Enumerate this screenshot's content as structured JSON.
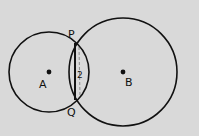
{
  "diagram": {
    "background": "#d9d9d9",
    "stroke_color": "#111111",
    "circles": [
      {
        "name": "A",
        "label": "A",
        "cx": 49,
        "cy": 72,
        "r": 40
      },
      {
        "name": "B",
        "label": "B",
        "cx": 123,
        "cy": 72,
        "r": 54
      }
    ],
    "points": {
      "P": {
        "label": "P",
        "x": 75,
        "y": 43
      },
      "Q": {
        "label": "Q",
        "x": 75,
        "y": 100
      }
    },
    "chord": {
      "from": "P",
      "to": "Q"
    },
    "region_label": "2"
  }
}
